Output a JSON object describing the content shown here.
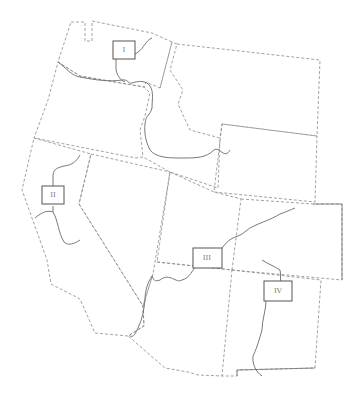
{
  "map": {
    "title": "",
    "regions": [
      {
        "id": "I",
        "label": "I"
      },
      {
        "id": "II",
        "label": "II"
      },
      {
        "id": "III",
        "label": "III"
      },
      {
        "id": "IV",
        "label": "IV"
      }
    ],
    "colors": {
      "background": "#ffffff",
      "border": "#8a8a8a",
      "river": "#6a6a6a",
      "label_box": "#555555"
    }
  }
}
